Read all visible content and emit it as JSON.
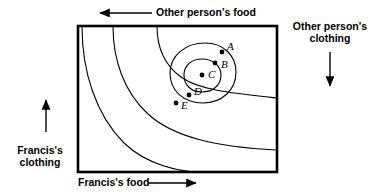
{
  "figure": {
    "type": "contour-diagram",
    "background_color": "#ffffff",
    "line_color": "#000000"
  },
  "axes": {
    "bottom": {
      "label": "Francis's food",
      "arrow": "right-arrow-icon",
      "direction": "right"
    },
    "left": {
      "label_line1": "Francis's",
      "label_line2": "clothing",
      "arrow": "up-arrow-icon",
      "direction": "up"
    },
    "top": {
      "label": "Other person's food",
      "arrow": "left-arrow-icon",
      "direction": "left"
    },
    "right": {
      "label_line1": "Other person's",
      "label_line2": "clothing",
      "arrow": "down-arrow-icon",
      "direction": "down"
    }
  },
  "plot_box": {
    "x": 78,
    "y": 26,
    "width": 199,
    "height": 146
  },
  "chart_data": {
    "type": "contour",
    "xlabel": "Francis's food",
    "ylabel": "Francis's clothing",
    "grid": false,
    "legend": "none",
    "center": {
      "x": 202,
      "y": 75
    },
    "points": [
      {
        "id": "A",
        "label": "A",
        "x": 222,
        "y": 52,
        "label_dx": 5,
        "label_dy": -5,
        "on_curve": 3
      },
      {
        "id": "B",
        "label": "B",
        "x": 215,
        "y": 63,
        "label_dx": 6,
        "label_dy": 2,
        "on_curve": 2
      },
      {
        "id": "C",
        "label": "C",
        "x": 202,
        "y": 75,
        "label_dx": 6,
        "label_dy": 0,
        "on_curve": 0
      },
      {
        "id": "D",
        "label": "D",
        "x": 189,
        "y": 95,
        "label_dx": 5,
        "label_dy": -3,
        "on_curve": 2
      },
      {
        "id": "E",
        "label": "E",
        "x": 176,
        "y": 103,
        "label_dx": 5,
        "label_dy": 3,
        "on_curve": 3
      }
    ],
    "curves": [
      {
        "name": "innermost-contour",
        "rank": 1,
        "path": "M 202 59 C 213 59 221 66 221 75 C 221 85 213 92 202 92 C 191 92 184 85 184 75 C 184 66 191 59 202 59 Z"
      },
      {
        "name": "second-contour",
        "rank": 2,
        "path": "M 205 43 C 224 43 236 56 236 72 C 236 90 222 103 203 103 C 183 103 170 90 170 73 C 170 56 185 43 205 43 Z"
      },
      {
        "name": "third-contour",
        "rank": 3,
        "path": "M 157 26 C 157 46 163 64 181 77 C 199 90 230 93 277 98"
      },
      {
        "name": "fourth-contour",
        "rank": 4,
        "path": "M 113 26 C 113 60 124 92 148 114 C 173 137 216 147 277 150"
      },
      {
        "name": "fifth-contour",
        "rank": 5,
        "path": "M 82 26 C 82 72 96 115 124 143 C 147 165 180 172 200 172"
      }
    ]
  }
}
